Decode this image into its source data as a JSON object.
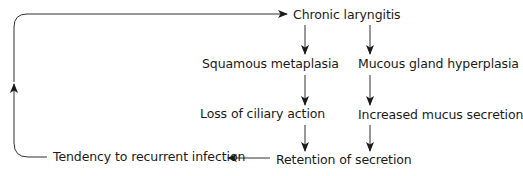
{
  "diagram": {
    "type": "flowchart",
    "nodes": [
      {
        "id": "chronic",
        "label": "Chronic laryngitis"
      },
      {
        "id": "squamous",
        "label": "Squamous metaplasia"
      },
      {
        "id": "mucous",
        "label": "Mucous gland hyperplasia"
      },
      {
        "id": "ciliary",
        "label": "Loss of ciliary action"
      },
      {
        "id": "mucus",
        "label": "Increased mucus secretion"
      },
      {
        "id": "retention",
        "label": "Retention of secretion"
      },
      {
        "id": "infection",
        "label": "Tendency to recurrent infection"
      }
    ],
    "edges": [
      {
        "from": "chronic",
        "to": "squamous"
      },
      {
        "from": "chronic",
        "to": "mucous"
      },
      {
        "from": "squamous",
        "to": "ciliary"
      },
      {
        "from": "mucous",
        "to": "mucus"
      },
      {
        "from": "ciliary",
        "to": "retention"
      },
      {
        "from": "mucus",
        "to": "retention"
      },
      {
        "from": "retention",
        "to": "infection"
      },
      {
        "from": "infection",
        "to": "chronic"
      }
    ],
    "colors": {
      "line": "#1a1a1a",
      "text": "#1a1a1a",
      "background": "#ffffff"
    }
  }
}
